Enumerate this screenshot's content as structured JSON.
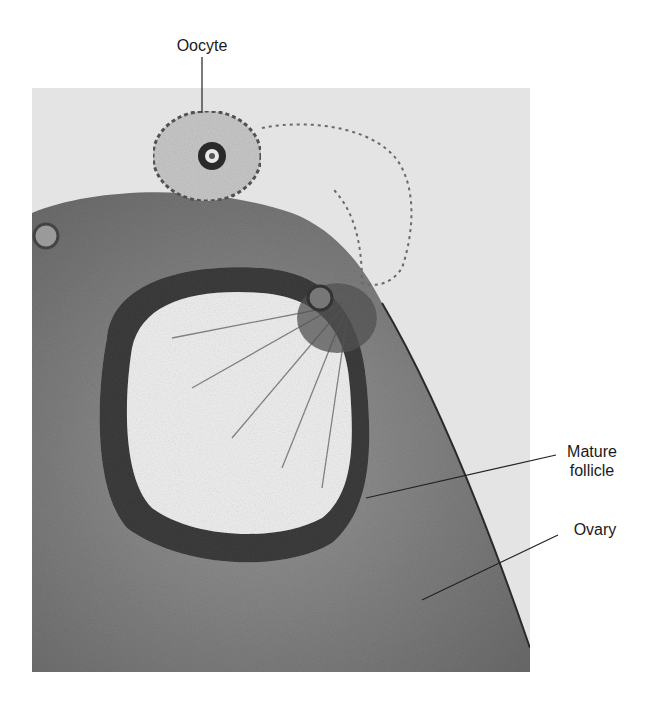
{
  "figure": {
    "labels": {
      "oocyte": "Oocyte",
      "mature_follicle_line1": "Mature",
      "mature_follicle_line2": "follicle",
      "ovary": "Ovary"
    },
    "colors": {
      "background": "#ffffff",
      "photo_bg": "#e6e6e6",
      "tissue_dark": "#3a3a3a",
      "tissue_mid": "#8a8a8a",
      "label_text": "#1a1a1a"
    }
  }
}
